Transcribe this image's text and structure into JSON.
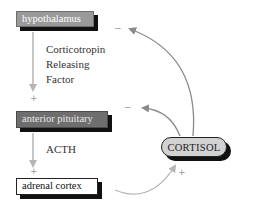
{
  "diagram": {
    "nodes": [
      {
        "id": "hypothalamus",
        "label": "hypothalamus",
        "style": "light-gray box",
        "color": "#9a9a9a"
      },
      {
        "id": "anterior_pituitary",
        "label": "anterior pituitary",
        "style": "dark-gray box",
        "color": "#6e6e6e"
      },
      {
        "id": "adrenal_cortex",
        "label": "adrenal cortex",
        "style": "white box",
        "color": "#ffffff"
      },
      {
        "id": "cortisol",
        "label": "CORTISOL",
        "style": "rounded pill",
        "color": "#d2d2d2"
      }
    ],
    "edges": [
      {
        "from": "hypothalamus",
        "to": "anterior_pituitary",
        "label": "Corticotropin Releasing Factor",
        "sign": "+"
      },
      {
        "from": "anterior_pituitary",
        "to": "adrenal_cortex",
        "label": "ACTH",
        "sign": "+"
      },
      {
        "from": "adrenal_cortex",
        "to": "cortisol",
        "label": "",
        "sign": "+"
      },
      {
        "from": "cortisol",
        "to": "hypothalamus",
        "label": "",
        "sign": "−"
      },
      {
        "from": "cortisol",
        "to": "anterior_pituitary",
        "label": "",
        "sign": "−"
      }
    ]
  },
  "labels": {
    "crf_line1": "Corticotropin",
    "crf_line2": "Releasing",
    "crf_line3": "Factor",
    "acth": "ACTH"
  },
  "signs": {
    "plus": "+",
    "minus": "−"
  },
  "colors": {
    "arrow": "#8a8a8a",
    "arrow_light": "#b5b5b5",
    "shadow": "#111111"
  }
}
